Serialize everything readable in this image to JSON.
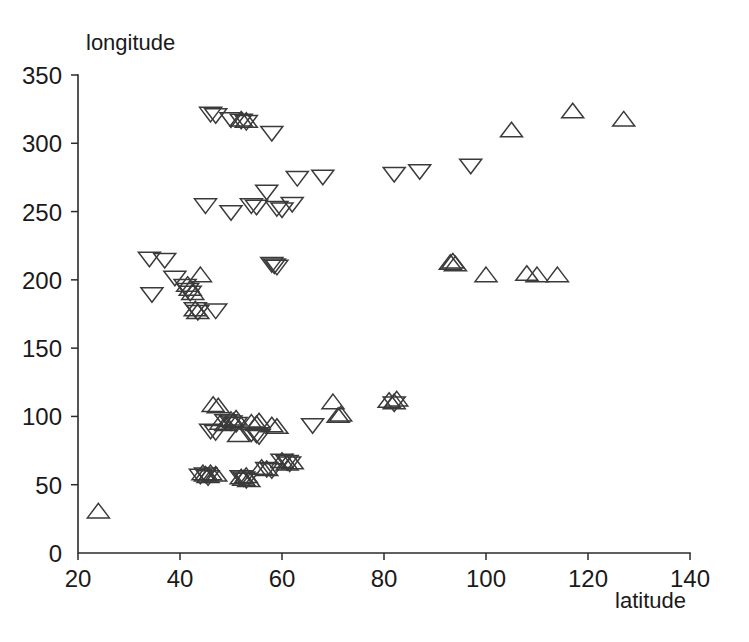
{
  "figure": {
    "background_color": "#ffffff",
    "marker_color": "#3a3a3a",
    "axis_color": "#2b2b2b"
  },
  "chart_data": {
    "type": "scatter",
    "title": "",
    "xlabel": "latitude",
    "ylabel": "longitude",
    "ylabel_position": "top-left-above-axis",
    "xlabel_position": "bottom-right-below-axis",
    "xlim": [
      20,
      140
    ],
    "ylim": [
      0,
      350
    ],
    "xticks": [
      20,
      40,
      60,
      80,
      100,
      120,
      140
    ],
    "yticks": [
      0,
      50,
      100,
      150,
      200,
      250,
      300,
      350
    ],
    "xticklabels": [
      "20",
      "40",
      "60",
      "80",
      "100",
      "120",
      "140"
    ],
    "yticklabels": [
      "0",
      "50",
      "100",
      "150",
      "200",
      "250",
      "300",
      "350"
    ],
    "grid": false,
    "legend": null,
    "tick_direction": "out",
    "spines": [
      "left",
      "bottom"
    ],
    "series": [
      {
        "name": "up-triangle",
        "marker": "triangle-up",
        "filled": false,
        "points": [
          [
            24.0,
            30.0
          ],
          [
            41.5,
            196.0
          ],
          [
            42.0,
            193.0
          ],
          [
            42.5,
            190.0
          ],
          [
            44.0,
            203.0
          ],
          [
            43.0,
            178.0
          ],
          [
            43.5,
            176.0
          ],
          [
            44.5,
            58.0
          ],
          [
            45.0,
            57.0
          ],
          [
            45.5,
            56.0
          ],
          [
            46.0,
            58.0
          ],
          [
            47.0,
            57.0
          ],
          [
            46.5,
            108.0
          ],
          [
            47.5,
            107.0
          ],
          [
            48.0,
            95.0
          ],
          [
            49.0,
            94.0
          ],
          [
            50.0,
            97.0
          ],
          [
            50.5,
            96.0
          ],
          [
            51.0,
            98.0
          ],
          [
            51.5,
            86.0
          ],
          [
            52.0,
            55.0
          ],
          [
            52.5,
            54.0
          ],
          [
            53.0,
            56.0
          ],
          [
            53.5,
            53.0
          ],
          [
            54.0,
            95.0
          ],
          [
            55.0,
            94.0
          ],
          [
            55.5,
            96.0
          ],
          [
            56.0,
            62.0
          ],
          [
            57.0,
            61.0
          ],
          [
            58.0,
            93.0
          ],
          [
            59.0,
            92.0
          ],
          [
            60.0,
            67.0
          ],
          [
            61.0,
            65.0
          ],
          [
            62.0,
            66.0
          ],
          [
            52.0,
            317.0
          ],
          [
            53.0,
            316.0
          ],
          [
            70.0,
            110.0
          ],
          [
            71.0,
            100.0
          ],
          [
            71.5,
            101.0
          ],
          [
            81.0,
            111.0
          ],
          [
            82.0,
            110.0
          ],
          [
            82.5,
            112.0
          ],
          [
            93.0,
            212.0
          ],
          [
            93.5,
            213.0
          ],
          [
            94.0,
            211.0
          ],
          [
            100.0,
            203.0
          ],
          [
            108.0,
            204.0
          ],
          [
            110.0,
            203.0
          ],
          [
            114.0,
            203.0
          ],
          [
            105.0,
            309.0
          ],
          [
            117.0,
            323.0
          ],
          [
            127.0,
            317.0
          ]
        ]
      },
      {
        "name": "down-triangle",
        "marker": "triangle-down",
        "filled": false,
        "points": [
          [
            34.0,
            216.0
          ],
          [
            37.0,
            215.0
          ],
          [
            34.5,
            190.0
          ],
          [
            39.0,
            202.0
          ],
          [
            41.0,
            196.0
          ],
          [
            41.5,
            193.0
          ],
          [
            42.0,
            191.0
          ],
          [
            43.0,
            179.0
          ],
          [
            43.5,
            177.0
          ],
          [
            47.0,
            178.0
          ],
          [
            45.0,
            255.0
          ],
          [
            50.0,
            250.0
          ],
          [
            46.0,
            322.0
          ],
          [
            47.0,
            321.0
          ],
          [
            50.0,
            318.0
          ],
          [
            52.0,
            317.0
          ],
          [
            53.0,
            316.0
          ],
          [
            58.0,
            308.0
          ],
          [
            58.0,
            212.0
          ],
          [
            58.5,
            211.0
          ],
          [
            59.0,
            210.0
          ],
          [
            54.0,
            255.0
          ],
          [
            55.0,
            254.0
          ],
          [
            57.0,
            265.0
          ],
          [
            59.0,
            253.0
          ],
          [
            60.0,
            252.0
          ],
          [
            62.0,
            256.0
          ],
          [
            63.0,
            275.0
          ],
          [
            68.0,
            276.0
          ],
          [
            82.0,
            278.0
          ],
          [
            87.0,
            280.0
          ],
          [
            97.0,
            284.0
          ],
          [
            44.0,
            57.0
          ],
          [
            45.0,
            58.0
          ],
          [
            45.5,
            56.0
          ],
          [
            46.0,
            90.0
          ],
          [
            47.0,
            89.0
          ],
          [
            49.0,
            97.0
          ],
          [
            50.0,
            96.0
          ],
          [
            51.0,
            95.0
          ],
          [
            52.0,
            56.0
          ],
          [
            52.5,
            55.0
          ],
          [
            53.0,
            54.0
          ],
          [
            54.0,
            88.0
          ],
          [
            55.0,
            87.0
          ],
          [
            55.5,
            86.0
          ],
          [
            57.0,
            62.0
          ],
          [
            58.0,
            61.0
          ],
          [
            60.0,
            68.0
          ],
          [
            61.0,
            67.0
          ],
          [
            61.5,
            66.0
          ],
          [
            66.0,
            94.0
          ],
          [
            82.0,
            110.0
          ]
        ]
      }
    ]
  }
}
